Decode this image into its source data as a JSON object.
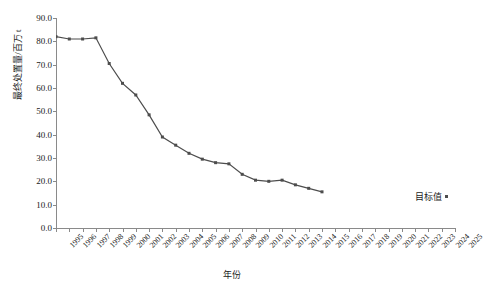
{
  "chart_data": {
    "type": "line",
    "title": "",
    "xlabel": "年份",
    "ylabel": "最终处置量/百万 t",
    "xlim": [
      1995,
      2025
    ],
    "ylim": [
      0,
      90
    ],
    "ytick_step": 10,
    "grid": false,
    "legend_position": "right-inside",
    "series_color": "#4d4d4d",
    "categories": [
      "1995",
      "1996",
      "1997",
      "1998",
      "1999",
      "2000",
      "2001",
      "2002",
      "2003",
      "2004",
      "2005",
      "2006",
      "2007",
      "2008",
      "2009",
      "2010",
      "2011",
      "2012",
      "2013",
      "2014",
      "2015",
      "2016",
      "2017",
      "2018",
      "2019",
      "2020",
      "2021",
      "2022",
      "2023",
      "2024",
      "2025"
    ],
    "series": [
      {
        "name": "目标值",
        "x": [
          1995,
          1996,
          1997,
          1998,
          1999,
          2000,
          2001,
          2002,
          2003,
          2004,
          2005,
          2006,
          2007,
          2008,
          2009,
          2010,
          2011,
          2012,
          2013,
          2014,
          2015
        ],
        "values": [
          82.0,
          81.0,
          81.0,
          81.5,
          70.5,
          62.0,
          57.0,
          48.5,
          39.0,
          35.5,
          32.0,
          29.5,
          28.0,
          27.5,
          23.0,
          20.5,
          20.0,
          20.5,
          18.5,
          17.0,
          15.5
        ]
      }
    ],
    "ytick_labels": [
      "90.0",
      "80.0",
      "70.0",
      "60.0",
      "50.0",
      "40.0",
      "30.0",
      "20.0",
      "10.0",
      "0.0"
    ],
    "ytick_values": [
      90,
      80,
      70,
      60,
      50,
      40,
      30,
      20,
      10,
      0
    ]
  },
  "legend": {
    "label": "目标值",
    "marker": "square-marker"
  }
}
